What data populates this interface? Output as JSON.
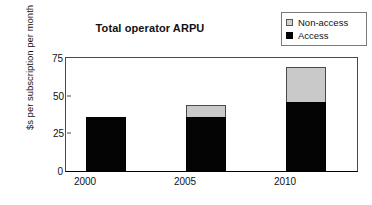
{
  "chart_data": {
    "type": "bar",
    "title": "Total operator ARPU",
    "xlabel": "",
    "ylabel": "$s per subscription per month",
    "categories": [
      "2000",
      "2005",
      "2010"
    ],
    "series": [
      {
        "name": "Access",
        "values": [
          36,
          36,
          46
        ],
        "color": "#000000"
      },
      {
        "name": "Non-access",
        "values": [
          0,
          8,
          23
        ],
        "color": "#c9c9c9"
      }
    ],
    "totals": [
      36,
      44,
      69
    ],
    "stacked": true,
    "ylim": [
      0,
      75
    ],
    "yticks": [
      {
        "label": "75",
        "value": 75
      },
      {
        "label": "50",
        "value": 50
      },
      {
        "label": "25",
        "value": 25
      },
      {
        "label": "0",
        "value": 0
      }
    ],
    "grid": false,
    "legend_position": "top-right",
    "legend": [
      {
        "label": "Non-access",
        "swatch": "legend-swatch-nonaccess"
      },
      {
        "label": "Access",
        "swatch": "legend-swatch-access"
      }
    ]
  }
}
